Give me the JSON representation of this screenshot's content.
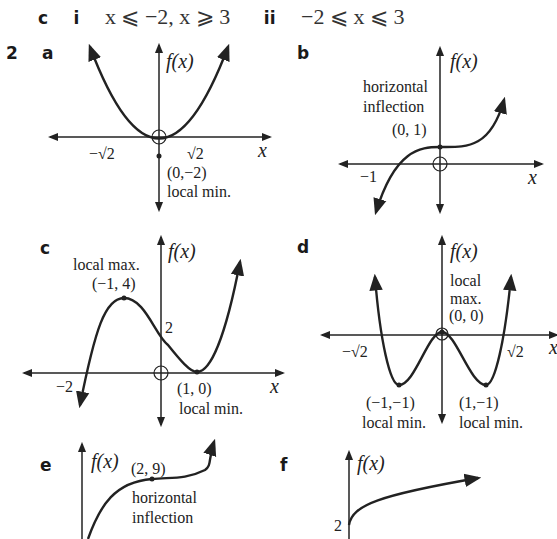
{
  "part_c_answers": {
    "label": "c",
    "i_label": "i",
    "i_text": "x ⩽ −2, x ⩾ 3",
    "ii_label": "ii",
    "ii_text": "−2 ⩽ x ⩽ 3"
  },
  "question": {
    "number": "2",
    "graphs": [
      {
        "label": "a",
        "y_axis": "f(x)",
        "x_axis": "x",
        "annotations": [
          "−√2",
          "√2",
          "(0,−2)",
          "local min."
        ]
      },
      {
        "label": "b",
        "y_axis": "f(x)",
        "x_axis": "x",
        "annotations": [
          "horizontal",
          "inflection",
          "(0, 1)",
          "−1"
        ]
      },
      {
        "label": "c",
        "y_axis": "f(x)",
        "x_axis": "x",
        "annotations": [
          "local max.",
          "(−1, 4)",
          "2",
          "−2",
          "(1, 0)",
          "local min."
        ]
      },
      {
        "label": "d",
        "y_axis": "f(x)",
        "x_axis": "x",
        "annotations": [
          "local",
          "max.",
          "(0, 0)",
          "−√2",
          "√2",
          "(−1,−1)",
          "local min.",
          "(1,−1)",
          "local min."
        ]
      },
      {
        "label": "e",
        "y_axis": "f(x)",
        "annotations": [
          "(2, 9)",
          "horizontal",
          "inflection"
        ]
      },
      {
        "label": "f",
        "y_axis": "f(x)",
        "annotations": [
          "2"
        ]
      }
    ]
  }
}
